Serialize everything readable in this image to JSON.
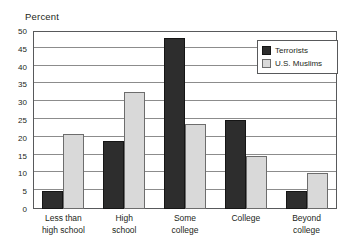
{
  "chart_data": {
    "type": "bar",
    "title": "",
    "ylabel": "Percent",
    "xlabel": "",
    "categories": [
      "Less than high school",
      "High school",
      "Some college",
      "College",
      "Beyond college"
    ],
    "category_lines": [
      [
        "Less than",
        "high school"
      ],
      [
        "High",
        "school"
      ],
      [
        "Some",
        "college"
      ],
      [
        "College",
        ""
      ],
      [
        "Beyond",
        "college"
      ]
    ],
    "series": [
      {
        "name": "Terrorists",
        "color": "#2d2d2d",
        "values": [
          5,
          19,
          48,
          25,
          5
        ]
      },
      {
        "name": "U.S. Muslims",
        "color": "#d9d9d9",
        "values": [
          21,
          33,
          24,
          15,
          10
        ]
      }
    ],
    "ylim": [
      0,
      50
    ],
    "ytick_step": 5,
    "yticks": [
      0,
      5,
      10,
      15,
      20,
      25,
      30,
      35,
      40,
      45,
      50
    ],
    "ytick_labels": [
      "0",
      "5",
      "10",
      "15",
      "20",
      "25",
      "30",
      "35",
      "40",
      "45",
      "50"
    ],
    "grid": true,
    "legend_position": "upper-right-inside"
  },
  "legend": {
    "entries": [
      {
        "label": "Terrorists"
      },
      {
        "label": "U.S. Muslims"
      }
    ]
  }
}
